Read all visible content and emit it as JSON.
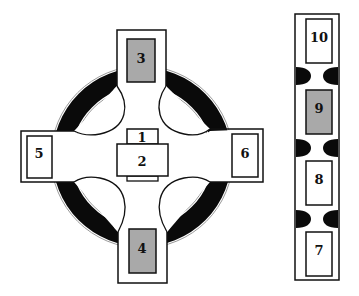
{
  "diagram": {
    "type": "floor-plan schematic",
    "colors": {
      "stroke": "#111111",
      "ring": "#0a0a0a",
      "shaded": "#a9a9a9",
      "background": "#ffffff"
    },
    "cross": {
      "boxes": [
        {
          "id": "1",
          "label": "1",
          "shaded": false
        },
        {
          "id": "2",
          "label": "2",
          "shaded": false
        },
        {
          "id": "3",
          "label": "3",
          "shaded": true
        },
        {
          "id": "4",
          "label": "4",
          "shaded": true
        },
        {
          "id": "5",
          "label": "5",
          "shaded": false
        },
        {
          "id": "6",
          "label": "6",
          "shaded": false
        }
      ]
    },
    "column": {
      "boxes": [
        {
          "id": "10",
          "label": "10",
          "shaded": false
        },
        {
          "id": "9",
          "label": "9",
          "shaded": true
        },
        {
          "id": "8",
          "label": "8",
          "shaded": false
        },
        {
          "id": "7",
          "label": "7",
          "shaded": false
        }
      ]
    }
  }
}
